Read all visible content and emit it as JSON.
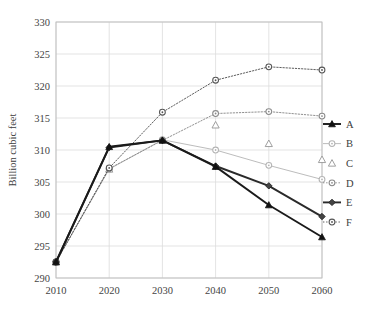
{
  "chart_data": {
    "type": "line",
    "title": "",
    "xlabel": "",
    "ylabel": "Billion cubic feet",
    "x": [
      2010,
      2020,
      2030,
      2040,
      2050,
      2060
    ],
    "xticks": [
      "2010",
      "2020",
      "2030",
      "2040",
      "2050",
      "2060"
    ],
    "yticks": [
      "290",
      "295",
      "300",
      "305",
      "310",
      "315",
      "320",
      "325",
      "330"
    ],
    "xlim": [
      2010,
      2060
    ],
    "ylim": [
      290,
      330
    ],
    "grid": true,
    "legend_position": "right",
    "series": [
      {
        "name": "A",
        "marker": "filled-triangle",
        "line": "solid",
        "color": "#1a1a1a",
        "values": [
          292.5,
          310.5,
          311.5,
          307.4,
          301.4,
          296.4
        ]
      },
      {
        "name": "B",
        "marker": "open-circle",
        "line": "solid",
        "color": "#b4b4b4",
        "values": [
          292.5,
          307.0,
          311.6,
          310.0,
          307.6,
          305.4
        ]
      },
      {
        "name": "C",
        "marker": "open-triangle",
        "line": "none",
        "color": "#9a9a9a",
        "values": [
          292.5,
          307.0,
          311.6,
          313.9,
          311.0,
          308.5
        ]
      },
      {
        "name": "D",
        "marker": "open-circle",
        "line": "dotted",
        "color": "#8a8a8a",
        "values": [
          292.5,
          307.1,
          311.5,
          315.7,
          316.0,
          315.3
        ]
      },
      {
        "name": "E",
        "marker": "filled-diamond",
        "line": "solid",
        "color": "#2a2a2a",
        "values": [
          292.5,
          310.4,
          311.5,
          307.5,
          304.4,
          299.6
        ]
      },
      {
        "name": "F",
        "marker": "open-circle",
        "line": "dotted",
        "color": "#555555",
        "values": [
          292.5,
          307.2,
          315.9,
          320.9,
          323.0,
          322.5
        ]
      }
    ]
  },
  "legend": {
    "items": [
      {
        "label": "A"
      },
      {
        "label": "B"
      },
      {
        "label": "C"
      },
      {
        "label": "D"
      },
      {
        "label": "E"
      },
      {
        "label": "F"
      }
    ]
  },
  "colors": {
    "grid": "#dcdcdc",
    "frame": "#bdbdbd",
    "background": "#ffffff",
    "text": "#3c3c3c"
  }
}
